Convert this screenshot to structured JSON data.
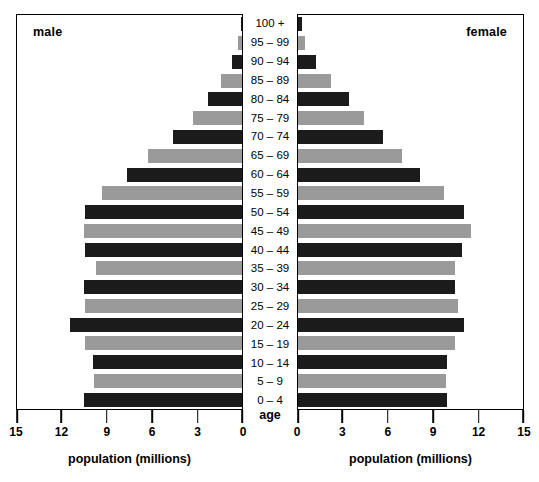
{
  "panels": {
    "male_label": "male",
    "female_label": "female"
  },
  "age_axis_title": "age",
  "axis_title_left": "population (millions)",
  "axis_title_right": "population (millions)",
  "colors": {
    "dark_bar": "#1b1b1b",
    "gray_bar": "#9a9a9a",
    "frame": "#000000",
    "background": "#ffffff"
  },
  "left_ticks": [
    "15",
    "12",
    "9",
    "6",
    "3",
    "0"
  ],
  "right_ticks": [
    "0",
    "3",
    "6",
    "9",
    "12",
    "15"
  ],
  "chart_data": {
    "type": "bar",
    "title": "",
    "subtitle": "",
    "orientation": "horizontal",
    "layout": "population-pyramid",
    "xlabel": "population (millions)",
    "ylabel": "age",
    "xlim": [
      0,
      15
    ],
    "grid": false,
    "legend_position": "none",
    "left_axis_direction": "reversed",
    "right_axis_direction": "normal",
    "categories": [
      "100 +",
      "95 – 99",
      "90 – 94",
      "85 – 89",
      "80 – 84",
      "75 – 79",
      "70 – 74",
      "65 – 69",
      "60 – 64",
      "55 – 59",
      "50 – 54",
      "45 – 49",
      "40 – 44",
      "35 – 39",
      "30 – 34",
      "25 – 29",
      "20 – 24",
      "15 – 19",
      "10 – 14",
      "5 – 9",
      "0 – 4"
    ],
    "series": [
      {
        "name": "male",
        "side": "left",
        "color": "alternating",
        "values": [
          0.1,
          0.3,
          0.7,
          1.4,
          2.3,
          3.3,
          4.6,
          6.3,
          7.7,
          9.4,
          10.5,
          10.6,
          10.5,
          9.8,
          10.6,
          10.5,
          11.5,
          10.5,
          10.0,
          9.9,
          10.6
        ]
      },
      {
        "name": "female",
        "side": "right",
        "color": "alternating",
        "values": [
          0.25,
          0.5,
          1.2,
          2.2,
          3.4,
          4.4,
          5.7,
          7.0,
          8.2,
          9.8,
          11.1,
          11.6,
          11.0,
          10.5,
          10.5,
          10.7,
          11.1,
          10.5,
          10.0,
          9.9,
          10.0
        ]
      }
    ]
  }
}
